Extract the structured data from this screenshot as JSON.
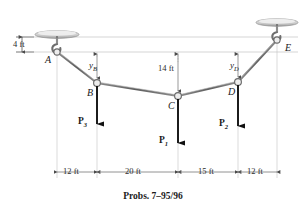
{
  "figure": {
    "caption": "Probs. 7–95/96",
    "type": "statics-cable-diagram",
    "colors": {
      "cable": "#6b6b6b",
      "load_arrow": "#111111",
      "dimension_line": "#9a9a9a",
      "support_plate": "#c9c9c9",
      "node_fill": "#ededed",
      "text": "#1a1a1a"
    },
    "supports": [
      {
        "name": "support-a",
        "label": "A",
        "type": "ceiling-hook-plate"
      },
      {
        "name": "support-e",
        "label": "E",
        "type": "ceiling-hook-plate"
      }
    ],
    "nodes": [
      {
        "id": "A",
        "label": "A"
      },
      {
        "id": "B",
        "label": "B"
      },
      {
        "id": "C",
        "label": "C"
      },
      {
        "id": "D",
        "label": "D"
      },
      {
        "id": "E",
        "label": "E"
      }
    ],
    "loads": [
      {
        "id": "P3",
        "label": "P",
        "sub": "3",
        "at_node": "B",
        "direction": "down"
      },
      {
        "id": "P1",
        "label": "P",
        "sub": "1",
        "at_node": "C",
        "direction": "down"
      },
      {
        "id": "P2",
        "label": "P",
        "sub": "2",
        "at_node": "D",
        "direction": "down"
      }
    ],
    "vertical_dimensions": [
      {
        "id": "h-offset",
        "label": "4 ft",
        "description": "ceiling to A"
      },
      {
        "id": "yB",
        "label": "y",
        "sub": "B",
        "description": "sag to B"
      },
      {
        "id": "sag-c",
        "label": "14 ft",
        "description": "sag to C"
      },
      {
        "id": "yD",
        "label": "y",
        "sub": "D",
        "description": "sag to D"
      }
    ],
    "horizontal_dimensions": [
      {
        "id": "span-ab",
        "label": "12 ft"
      },
      {
        "id": "span-bc",
        "label": "20 ft"
      },
      {
        "id": "span-cd",
        "label": "15 ft"
      },
      {
        "id": "span-de",
        "label": "12 ft"
      }
    ]
  }
}
